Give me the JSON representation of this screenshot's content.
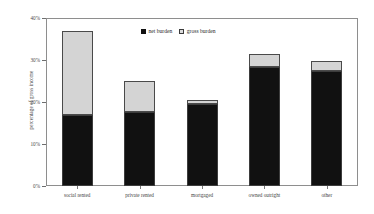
{
  "chart_data": {
    "type": "bar",
    "title": "",
    "xlabel": "",
    "ylabel": "percentage of gross income",
    "categories": [
      "social rented",
      "private rented",
      "mortgaged",
      "owned outright",
      "other"
    ],
    "series": [
      {
        "name": "net burden",
        "values": [
          16.9,
          17.6,
          19.5,
          28.3,
          27.4
        ]
      },
      {
        "name": "gross burden",
        "values": [
          36.9,
          25.0,
          20.5,
          31.4,
          29.8
        ]
      }
    ],
    "stacked_display": "gross burden drawn as total height, net burden filled from baseline",
    "ylim": [
      0,
      40
    ],
    "yticks": [
      0,
      10,
      20,
      30,
      40
    ],
    "ytick_labels": [
      "0%",
      "10%",
      "20%",
      "30%",
      "40%"
    ],
    "grid": false,
    "legend_position": "top-center",
    "colors": {
      "net_burden": "#111111",
      "gross_burden": "#d4d4d4",
      "axis": "#8e8e8e",
      "background": "#ffffff"
    }
  },
  "legend": {
    "items": [
      {
        "label": "net burden",
        "swatch": "filled-black-square"
      },
      {
        "label": "gross burden",
        "swatch": "light-gray-square"
      }
    ]
  }
}
